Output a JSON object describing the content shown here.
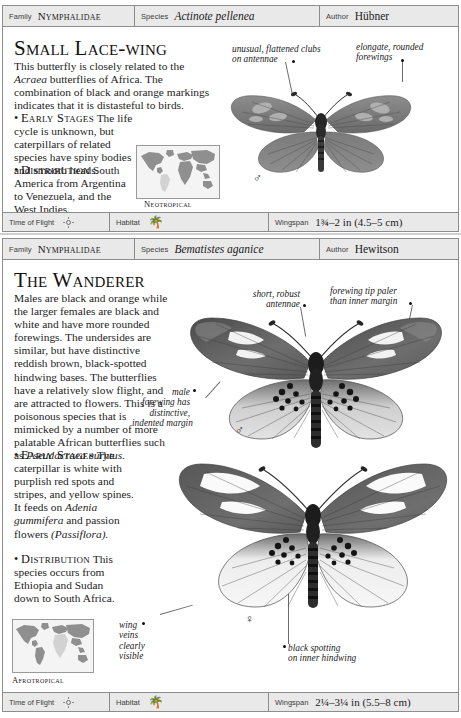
{
  "page": {
    "background": "#ffffff",
    "header_bg": "#e9e9e9",
    "rule_color": "#3a3a3a"
  },
  "entries": [
    {
      "header": {
        "family_label": "Family",
        "family_value": "Nymphalidae",
        "species_label": "Species",
        "species_value": "Actinote pellenea",
        "author_label": "Author",
        "author_value": "Hübner"
      },
      "title": "Small Lace-wing",
      "description": [
        {
          "text": "This butterfly is closely related to the ",
          "style": "normal"
        },
        {
          "text": "Acraea",
          "style": "italic"
        },
        {
          "text": " butterflies of Africa. The combination of black and orange markings indicates that it is distasteful to birds.",
          "style": "normal"
        }
      ],
      "sections": [
        {
          "bullet": "•",
          "heading": "Early Stages",
          "text": "The life cycle is unknown, but caterpillars of related species have spiny bodies and smooth heads."
        },
        {
          "bullet": "•",
          "heading": "Distribution",
          "text": "South America from Argentina to Venezuela, and the West Indies."
        }
      ],
      "map": {
        "caption": "Neotropical",
        "region": "south-america",
        "land_color": "#8f8f8f",
        "highlight_color": "#d2d2d2",
        "sea_color": "#f4f4f4"
      },
      "annotations": [
        {
          "name": "antennae-clubs",
          "lines": [
            "unusual, flattened clubs",
            "on antennae"
          ]
        },
        {
          "name": "forewings",
          "lines": [
            "elongate, rounded",
            "forewings"
          ]
        }
      ],
      "specimens": [
        {
          "sex_symbol": "♂",
          "sex": "male"
        }
      ],
      "footer": {
        "time_of_flight_label": "Time of Flight",
        "time_of_flight_icon": "sun-icon",
        "habitat_label": "Habitat",
        "habitat_icon": "palm-tree-icon",
        "wingspan_label": "Wingspan",
        "wingspan_value": "1¾–2 in (4.5–5 cm)"
      }
    },
    {
      "header": {
        "family_label": "Family",
        "family_value": "Nymphalidae",
        "species_label": "Species",
        "species_value": "Bematistes aganice",
        "author_label": "Author",
        "author_value": "Hewitson"
      },
      "title": "The Wanderer",
      "description": [
        {
          "text": "Males are black and orange while the larger females are black and white and have more rounded forewings. The undersides are similar, but have distinctive reddish brown, black-spotted hindwing bases. The butterflies have a relatively slow flight, and are attracted to flowers. This is a poisonous species that is mimicked by a number of more palatable African butterflies such as ",
          "style": "normal"
        },
        {
          "text": "Pseudacraea eurytus.",
          "style": "italic"
        }
      ],
      "sections": [
        {
          "bullet": "•",
          "heading": "Early Stages",
          "text_parts": [
            {
              "text": "The caterpillar is white with purplish red spots and stripes, and yellow spines. It feeds on ",
              "style": "normal"
            },
            {
              "text": "Adenia gummifera",
              "style": "italic"
            },
            {
              "text": " and passion flowers ",
              "style": "normal"
            },
            {
              "text": "(Passiflora).",
              "style": "italic"
            }
          ]
        },
        {
          "bullet": "•",
          "heading": "Distribution",
          "text": "This species occurs from Ethiopia and Sudan down to South Africa."
        }
      ],
      "map": {
        "caption": "Afrotropical",
        "region": "africa",
        "land_color": "#8f8f8f",
        "highlight_color": "#d2d2d2",
        "sea_color": "#f4f4f4"
      },
      "annotations": [
        {
          "name": "antennae",
          "lines": [
            "short, robust",
            "antennae"
          ]
        },
        {
          "name": "forewing-tip",
          "lines": [
            "forewing tip paler",
            "than inner margin"
          ]
        },
        {
          "name": "male-forewing-margin",
          "lines": [
            "male",
            "forewing has",
            "distinctive,",
            "indented margin"
          ]
        },
        {
          "name": "wing-veins",
          "lines": [
            "wing",
            "veins",
            "clearly",
            "visible"
          ]
        },
        {
          "name": "black-spotting",
          "lines": [
            "black spotting",
            "on inner hindwing"
          ]
        }
      ],
      "specimens": [
        {
          "sex_symbol": "♂",
          "sex": "male"
        },
        {
          "sex_symbol": "♀",
          "sex": "female"
        }
      ],
      "footer": {
        "time_of_flight_label": "Time of Flight",
        "time_of_flight_icon": "sun-icon",
        "habitat_label": "Habitat",
        "habitat_icon": "palm-tree-icon",
        "wingspan_label": "Wingspan",
        "wingspan_value": "2¼–3¼ in (5.5–8 cm)"
      }
    }
  ]
}
